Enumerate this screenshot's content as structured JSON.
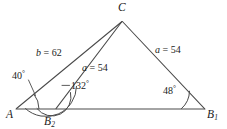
{
  "figure": {
    "kind": "triangle-ambiguous-case-diagram",
    "stroke_color": "#4a4a4a",
    "text_color": "#1b1b1b",
    "background": "#ffffff",
    "width": 227,
    "height": 129
  },
  "vertices": {
    "C": {
      "label": "C",
      "subscript": "",
      "x": 122,
      "y": 21
    },
    "A": {
      "label": "A",
      "subscript": "",
      "x": 16,
      "y": 109
    },
    "B1": {
      "label": "B",
      "subscript": "1",
      "x": 204,
      "y": 109
    },
    "B2": {
      "label": "B",
      "subscript": "2",
      "x": 56,
      "y": 109
    }
  },
  "sides": [
    {
      "name": "side-b",
      "var": "b",
      "equals": "=",
      "value": "62",
      "text": "b = 62",
      "from": "A",
      "to": "C"
    },
    {
      "name": "side-a-right",
      "var": "a",
      "equals": "=",
      "value": "54",
      "text": "a = 54",
      "from": "C",
      "to": "B1"
    },
    {
      "name": "side-a-inner",
      "var": "a",
      "equals": "=",
      "value": "54",
      "text": "a = 54",
      "from": "C",
      "to": "B2"
    }
  ],
  "angles": [
    {
      "name": "angle-at-A",
      "value": "40",
      "degree": "°",
      "text": "40°",
      "at": "A",
      "has_leader": true
    },
    {
      "name": "angle-at-B2",
      "value": "132",
      "degree": "°",
      "text": "132°",
      "at": "B2",
      "has_leader": true
    },
    {
      "name": "angle-at-B1",
      "value": "48",
      "degree": "°",
      "text": "48°",
      "at": "B1",
      "has_leader": false
    }
  ]
}
